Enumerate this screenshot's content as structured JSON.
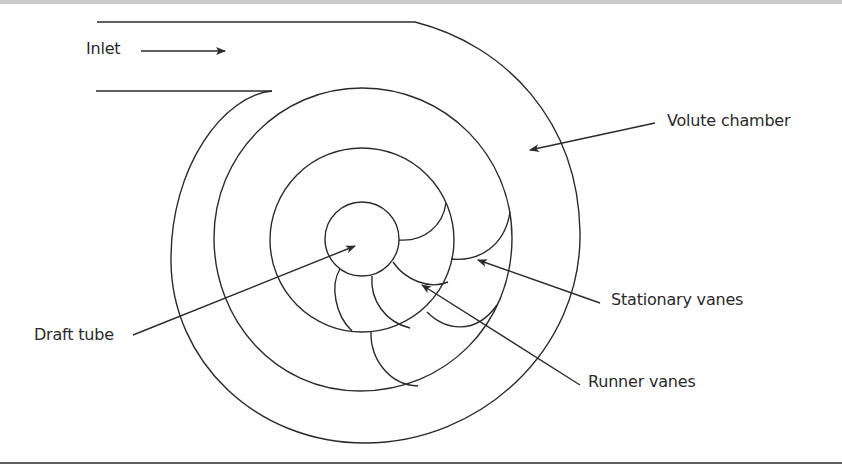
{
  "figure": {
    "type": "diagram",
    "labels": {
      "inlet": "Inlet",
      "volute_chamber": "Volute chamber",
      "stationary_vanes": "Stationary vanes",
      "draft_tube": "Draft tube",
      "runner_vanes": "Runner vanes"
    },
    "colors": {
      "line": "#2b2b2b",
      "background": "#ffffff",
      "top_band": "#cacaca"
    }
  }
}
